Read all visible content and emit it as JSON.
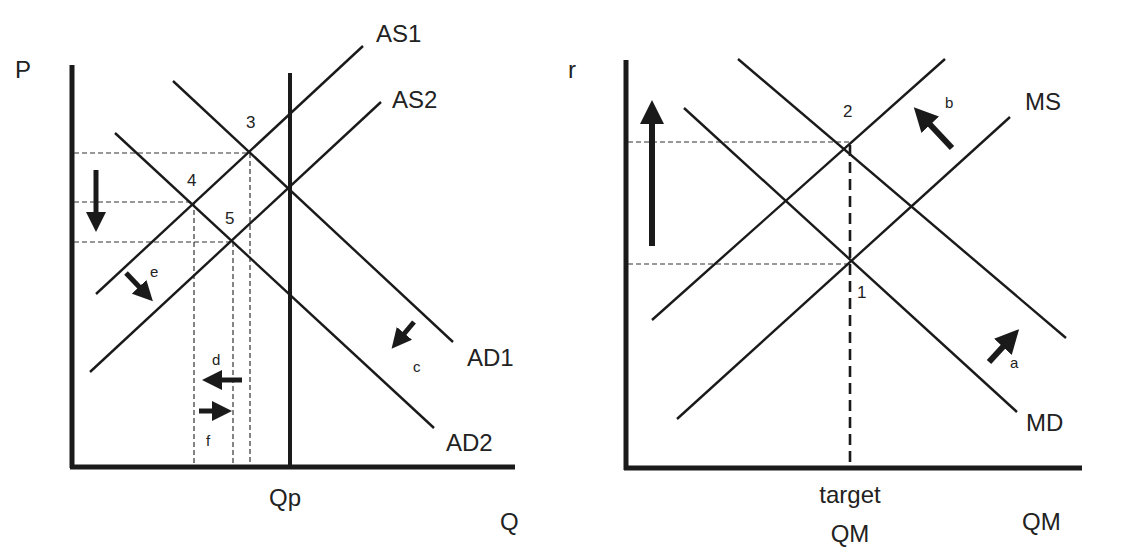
{
  "left_panel": {
    "y_axis_label": "P",
    "x_axis_label": "Q",
    "x_tick_label": "Qp",
    "curves": {
      "as1": "AS1",
      "as2": "AS2",
      "ad1": "AD1",
      "ad2": "AD2"
    },
    "points": {
      "p3": "3",
      "p4": "4",
      "p5": "5"
    },
    "arrow_labels": {
      "c": "c",
      "d": "d",
      "e": "e",
      "f": "f"
    }
  },
  "right_panel": {
    "y_axis_label": "r",
    "x_axis_label": "QM",
    "x_tick_label_line1": "target",
    "x_tick_label_line2": "QM",
    "curves": {
      "ms": "MS",
      "md": "MD"
    },
    "points": {
      "p1": "1",
      "p2": "2"
    },
    "arrow_labels": {
      "a": "a",
      "b": "b"
    }
  },
  "colors": {
    "ink": "#1a1a1a",
    "background": "#ffffff"
  }
}
